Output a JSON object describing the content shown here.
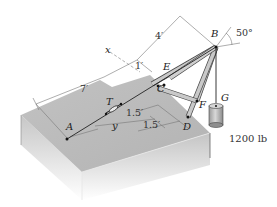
{
  "figure": {
    "type": "statics diagram",
    "points": {
      "A": "A",
      "B": "B",
      "C": "C",
      "D": "D",
      "E": "E",
      "F": "F",
      "G": "G",
      "T": "T"
    },
    "axes": {
      "x": "x",
      "y": "y"
    },
    "dimensions": {
      "d_7ft": "7′",
      "d_1ft": "1′",
      "d_4ft": "4′",
      "d_1_5ft_a": "1.5′",
      "d_1_5ft_b": "1.5′"
    },
    "angle": "50°",
    "load": "1200 lb"
  },
  "colors": {
    "platform_top": "#b9b9b9",
    "platform_side_left": "#c8c8c8",
    "platform_side_front": "#d2d2d2",
    "member": "#bdbdbd",
    "cable": "#222222"
  }
}
